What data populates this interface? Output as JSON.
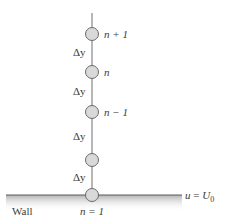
{
  "diagram": {
    "title": "",
    "nodes": [
      {
        "id": "node-n-plus-1",
        "label": "n + 1"
      },
      {
        "id": "node-n",
        "label": "n"
      },
      {
        "id": "node-n-minus-1",
        "label": "n − 1"
      },
      {
        "id": "node-2",
        "label": ""
      },
      {
        "id": "node-1",
        "label": "n = 1"
      }
    ],
    "spacing_labels": [
      "Δy",
      "Δy",
      "Δy",
      "Δy"
    ],
    "wall_label": "Wall",
    "boundary_condition": {
      "var": "u",
      "eq": " = ",
      "value": "U",
      "subscript": "0"
    },
    "colors": {
      "line": "#6e6e6e",
      "node_fill": "#d9d9d9",
      "node_stroke": "#6a6a6a",
      "wall_shade": "#b8b8b8",
      "text": "#3a3a3a"
    }
  }
}
